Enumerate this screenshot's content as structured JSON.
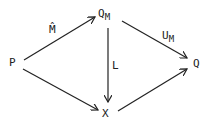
{
  "nodes": [
    {
      "id": "P",
      "label": "P",
      "sub": ""
    },
    {
      "id": "QM",
      "label": "Q",
      "sub": "M"
    },
    {
      "id": "Q",
      "label": "Q",
      "sub": ""
    },
    {
      "id": "X",
      "label": "X",
      "sub": ""
    }
  ],
  "edges": [
    {
      "from": "P",
      "to": "QM",
      "label": "M̂",
      "sub": ""
    },
    {
      "from": "QM",
      "to": "Q",
      "label": "U",
      "sub": "M"
    },
    {
      "from": "QM",
      "to": "X",
      "label": "L",
      "sub": ""
    },
    {
      "from": "P",
      "to": "X",
      "label": "",
      "sub": ""
    },
    {
      "from": "X",
      "to": "Q",
      "label": "",
      "sub": ""
    }
  ],
  "colors": {
    "stroke": "#222222",
    "background": "#ffffff"
  }
}
